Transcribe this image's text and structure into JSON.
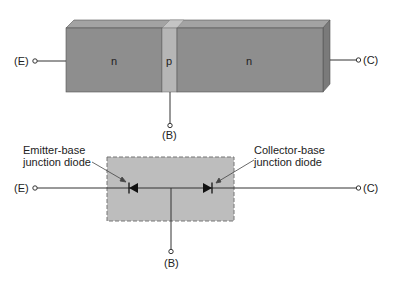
{
  "top_diagram": {
    "regions": [
      {
        "label": "n",
        "kind": "emitter"
      },
      {
        "label": "p",
        "kind": "base"
      },
      {
        "label": "n",
        "kind": "collector"
      }
    ],
    "terminals": {
      "emitter": "(E)",
      "base": "(B)",
      "collector": "(C)"
    }
  },
  "bottom_diagram": {
    "annotations": {
      "emitter_base": [
        "Emitter-base",
        "junction diode"
      ],
      "collector_base": [
        "Collector-base",
        "junction diode"
      ]
    },
    "terminals": {
      "emitter": "(E)",
      "base": "(B)",
      "collector": "(C)"
    }
  },
  "colors": {
    "n_region": "#8c8c8c",
    "p_region": "#b4b4b4",
    "block_top": "#a0a0a0",
    "block_side": "#7a7a7a",
    "dashed_box_fill": "#bdbdbd",
    "line": "#333333"
  }
}
